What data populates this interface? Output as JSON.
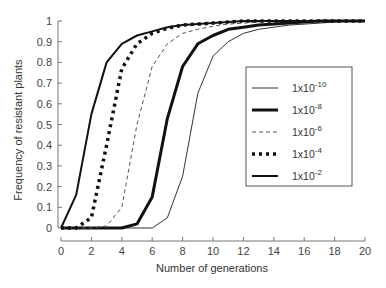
{
  "chart_data": {
    "type": "line",
    "title": "",
    "xlabel": "Number of generations",
    "ylabel": "Frequency of resistant plants",
    "xlim": [
      0,
      20
    ],
    "ylim": [
      0,
      1
    ],
    "x_ticks": [
      0,
      2,
      4,
      6,
      8,
      10,
      12,
      14,
      16,
      18,
      20
    ],
    "y_ticks": [
      0,
      0.1,
      0.2,
      0.3,
      0.4,
      0.5,
      0.6,
      0.7,
      0.8,
      0.9,
      1
    ],
    "x_tick_labels": [
      "0",
      "2",
      "4",
      "6",
      "8",
      "10",
      "12",
      "14",
      "16",
      "18",
      "20"
    ],
    "y_tick_labels": [
      "0",
      "0.1",
      "0.2",
      "0.3",
      "0.4",
      "0.5",
      "0.6",
      "0.7",
      "0.8",
      "0.9",
      "1"
    ],
    "grid": false,
    "legend_position": "right-center (inside)",
    "x": [
      0,
      1,
      2,
      3,
      4,
      5,
      6,
      7,
      8,
      9,
      10,
      11,
      12,
      13,
      14,
      15,
      16,
      17,
      18,
      19,
      20
    ],
    "series": [
      {
        "name": "1x10-10",
        "legend_base": "1x10",
        "legend_exp": "-10",
        "style": "thin-solid",
        "values": [
          0,
          0,
          0,
          0,
          0,
          0,
          0,
          0.05,
          0.25,
          0.65,
          0.83,
          0.9,
          0.94,
          0.96,
          0.97,
          0.98,
          0.985,
          0.99,
          0.995,
          1.0,
          1.0
        ]
      },
      {
        "name": "1x10-8",
        "legend_base": "1x10",
        "legend_exp": "-8",
        "style": "thick-solid",
        "values": [
          0,
          0,
          0,
          0,
          0,
          0.02,
          0.15,
          0.53,
          0.78,
          0.89,
          0.93,
          0.96,
          0.97,
          0.98,
          0.985,
          0.99,
          0.995,
          1.0,
          1.0,
          1.0,
          1.0
        ]
      },
      {
        "name": "1x10-6",
        "legend_base": "1x10",
        "legend_exp": "-6",
        "style": "thin-dashed",
        "values": [
          0,
          0,
          0,
          0.01,
          0.1,
          0.5,
          0.78,
          0.89,
          0.94,
          0.96,
          0.975,
          0.985,
          0.99,
          0.995,
          1.0,
          1.0,
          1.0,
          1.0,
          1.0,
          1.0,
          1.0
        ]
      },
      {
        "name": "1x10-4",
        "legend_base": "1x10",
        "legend_exp": "-4",
        "style": "thick-dotted",
        "values": [
          0,
          0,
          0.05,
          0.4,
          0.77,
          0.89,
          0.94,
          0.965,
          0.98,
          0.985,
          0.99,
          0.995,
          1.0,
          1.0,
          1.0,
          1.0,
          1.0,
          1.0,
          1.0,
          1.0,
          1.0
        ]
      },
      {
        "name": "1x10-2",
        "legend_base": "1x10",
        "legend_exp": "-2",
        "style": "medium-solid",
        "values": [
          0,
          0.16,
          0.55,
          0.8,
          0.89,
          0.93,
          0.95,
          0.97,
          0.98,
          0.985,
          0.99,
          0.995,
          1.0,
          1.0,
          1.0,
          1.0,
          1.0,
          1.0,
          1.0,
          1.0,
          1.0
        ]
      }
    ]
  },
  "colors": {
    "axis": "#777777",
    "line": "#1a1a1a",
    "dashed": "#666666",
    "legend_border": "#555555"
  }
}
